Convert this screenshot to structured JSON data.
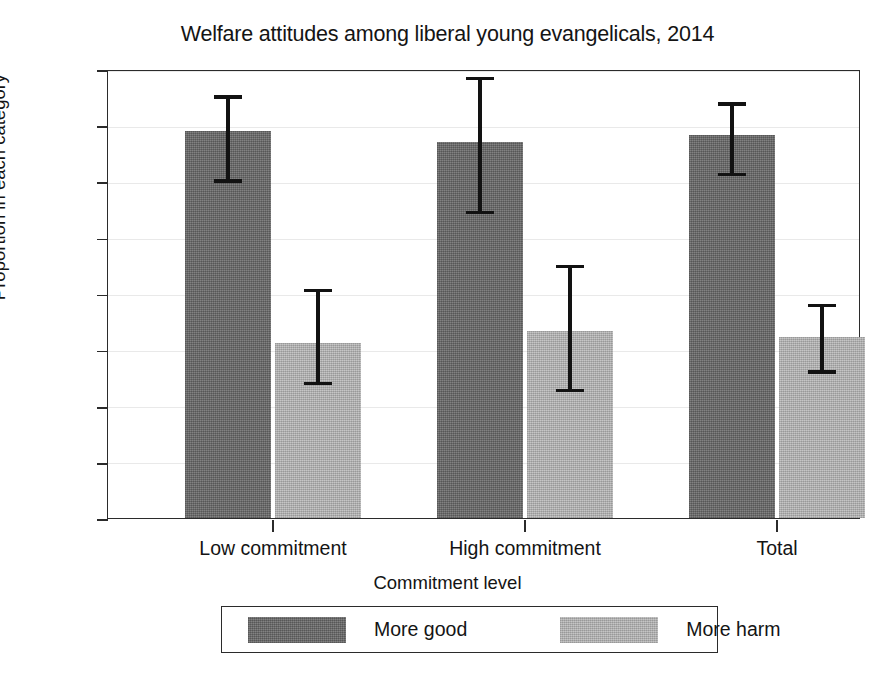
{
  "chart_data": {
    "type": "bar",
    "title": "Welfare attitudes among liberal young evangelicals, 2014",
    "xlabel": "Commitment level",
    "ylabel": "Proportion in each category",
    "categories": [
      "Low commitment",
      "High commitment",
      "Total"
    ],
    "ylim": [
      0,
      0.8
    ],
    "ytick_labels": [
      "0",
      ".1",
      ".2",
      ".3",
      ".4",
      ".5",
      ".6",
      ".7",
      ".8"
    ],
    "ytick_values": [
      0,
      0.1,
      0.2,
      0.3,
      0.4,
      0.5,
      0.6,
      0.7,
      0.8
    ],
    "grid": true,
    "legend_position": "bottom",
    "error_bars": "95% confidence interval",
    "series": [
      {
        "name": "More good",
        "color": "#737373",
        "values": [
          0.69,
          0.67,
          0.683
        ],
        "ci_low": [
          0.601,
          0.545,
          0.613
        ],
        "ci_high": [
          0.757,
          0.79,
          0.744
        ]
      },
      {
        "name": "More harm",
        "color": "#b9b9b9",
        "values": [
          0.312,
          0.334,
          0.322
        ],
        "ci_low": [
          0.24,
          0.228,
          0.261
        ],
        "ci_high": [
          0.412,
          0.455,
          0.385
        ]
      }
    ]
  },
  "legend": {
    "entries": [
      {
        "label": "More good",
        "swatch": "dark-gray-hatched-swatch"
      },
      {
        "label": "More harm",
        "swatch": "light-gray-hatched-swatch"
      }
    ]
  }
}
